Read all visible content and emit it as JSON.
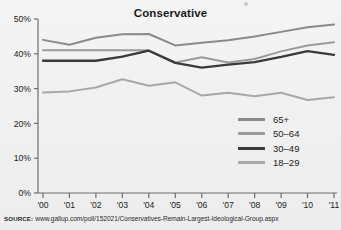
{
  "chart_data": {
    "type": "line",
    "title": "Conservative",
    "xlabel": "",
    "ylabel": "",
    "x": [
      "'00",
      "'01",
      "'02",
      "'03",
      "'04",
      "'05",
      "'06",
      "'07",
      "'08",
      "'09",
      "'10",
      "'11"
    ],
    "categories": [
      "'00",
      "'01",
      "'02",
      "'03",
      "'04",
      "'05",
      "'06",
      "'07",
      "'08",
      "'09",
      "'10",
      "'11"
    ],
    "ylim": [
      0,
      50
    ],
    "yticks": [
      0,
      10,
      20,
      30,
      40,
      50
    ],
    "ytick_labels": [
      "0%",
      "10%",
      "20%",
      "30%",
      "40%",
      "50%"
    ],
    "grid": false,
    "legend_position": "inside-lower-right",
    "series": [
      {
        "name": "65+",
        "color": "#8a8a8a",
        "values": [
          44.0,
          42.6,
          44.6,
          45.6,
          45.7,
          42.4,
          43.2,
          43.9,
          45.0,
          46.3,
          47.6,
          48.4
        ]
      },
      {
        "name": "50–64",
        "color": "#9b9b9b",
        "values": [
          41.0,
          41.0,
          41.0,
          41.0,
          41.0,
          37.5,
          39.0,
          37.5,
          38.5,
          40.7,
          42.4,
          43.3
        ]
      },
      {
        "name": "30–49",
        "color": "#3a3a3a",
        "values": [
          38.0,
          38.0,
          38.0,
          39.2,
          40.9,
          37.4,
          36.0,
          36.9,
          37.6,
          39.1,
          40.8,
          39.7
        ]
      },
      {
        "name": "18–29",
        "color": "#a8a8a8",
        "values": [
          28.9,
          29.2,
          30.3,
          32.7,
          30.8,
          31.8,
          28.0,
          28.8,
          27.8,
          28.8,
          26.7,
          27.5
        ]
      }
    ]
  },
  "legend": {
    "items": [
      {
        "label": "65+",
        "color": "#8a8a8a"
      },
      {
        "label": "50–64",
        "color": "#9b9b9b"
      },
      {
        "label": "30–49",
        "color": "#3a3a3a"
      },
      {
        "label": "18–29",
        "color": "#a8a8a8"
      }
    ]
  },
  "source": {
    "label": "SOURCE:",
    "url": "www.gallup.com/poll/152021/Conservatives-Remain-Largest-Ideological-Group.aspx"
  },
  "axis": {
    "color": "#6e6e6e"
  }
}
